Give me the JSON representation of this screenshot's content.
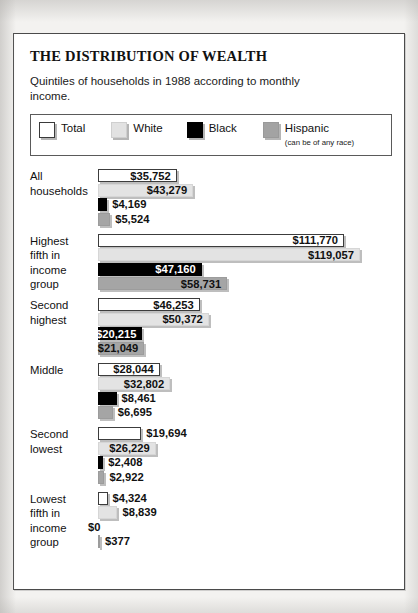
{
  "title": "THE DISTRIBUTION OF WEALTH",
  "subtitle": "Quintiles of households in 1988 according to monthly income.",
  "legend": {
    "total": "Total",
    "white": "White",
    "black": "Black",
    "hispanic": "Hispanic",
    "hispanic_note": "(can be of any race)"
  },
  "colors": {
    "total": "#ffffff",
    "white": "#e3e3e3",
    "black": "#000000",
    "hispanic": "#a5a5a5",
    "frame": "#4a4a4a",
    "text": "#111111"
  },
  "chart_data": {
    "type": "bar",
    "orientation": "horizontal",
    "title": "THE DISTRIBUTION OF WEALTH",
    "subtitle": "Quintiles of households in 1988 according to monthly income.",
    "xlabel": "",
    "ylabel": "",
    "grid": false,
    "legend_position": "top",
    "axis_max": 119057,
    "categories": [
      "All households",
      "Highest fifth in income group",
      "Second highest",
      "Middle",
      "Second lowest",
      "Lowest fifth in income group"
    ],
    "series": [
      {
        "name": "Total",
        "values": [
          35752,
          111770,
          46253,
          28044,
          19694,
          4324
        ]
      },
      {
        "name": "White",
        "values": [
          43279,
          119057,
          50372,
          32802,
          26229,
          8839
        ]
      },
      {
        "name": "Black",
        "values": [
          4169,
          47160,
          20215,
          8461,
          2408,
          0
        ]
      },
      {
        "name": "Hispanic",
        "values": [
          5524,
          58731,
          21049,
          6695,
          2922,
          377
        ]
      }
    ],
    "value_labels": [
      {
        "category": "All households",
        "labels": [
          "$35,752",
          "$43,279",
          "$4,169",
          "$5,524"
        ]
      },
      {
        "category": "Highest fifth in income group",
        "labels": [
          "$111,770",
          "$119,057",
          "$47,160",
          "$58,731"
        ]
      },
      {
        "category": "Second highest",
        "labels": [
          "$46,253",
          "$50,372",
          "$20,215",
          "$21,049"
        ]
      },
      {
        "category": "Middle",
        "labels": [
          "$28,044",
          "$32,802",
          "$8,461",
          "$6,695"
        ]
      },
      {
        "category": "Second lowest",
        "labels": [
          "$19,694",
          "$26,229",
          "$2,408",
          "$2,922"
        ]
      },
      {
        "category": "Lowest fifth in income group",
        "labels": [
          "$4,324",
          "$8,839",
          "$0",
          "$377"
        ]
      }
    ]
  },
  "groups": [
    {
      "label": "All\nhouseholds",
      "rows": [
        {
          "series": "total",
          "value": 35752,
          "label": "$35,752",
          "placement": "inside-light"
        },
        {
          "series": "white",
          "value": 43279,
          "label": "$43,279",
          "placement": "inside-light"
        },
        {
          "series": "black",
          "value": 4169,
          "label": "$4,169",
          "placement": "outside"
        },
        {
          "series": "hisp",
          "value": 5524,
          "label": "$5,524",
          "placement": "outside"
        }
      ]
    },
    {
      "label": "Highest\nfifth in\nincome\ngroup",
      "rows": [
        {
          "series": "total",
          "value": 111770,
          "label": "$111,770",
          "placement": "inside-light"
        },
        {
          "series": "white",
          "value": 119057,
          "label": "$119,057",
          "placement": "inside-light"
        },
        {
          "series": "black",
          "value": 47160,
          "label": "$47,160",
          "placement": "inside-dark"
        },
        {
          "series": "hisp",
          "value": 58731,
          "label": "$58,731",
          "placement": "inside-light"
        }
      ]
    },
    {
      "label": "Second\nhighest",
      "rows": [
        {
          "series": "total",
          "value": 46253,
          "label": "$46,253",
          "placement": "inside-light"
        },
        {
          "series": "white",
          "value": 50372,
          "label": "$50,372",
          "placement": "inside-light"
        },
        {
          "series": "black",
          "value": 20215,
          "label": "$20,215",
          "placement": "inside-dark"
        },
        {
          "series": "hisp",
          "value": 21049,
          "label": "$21,049",
          "placement": "inside-light"
        }
      ]
    },
    {
      "label": "Middle",
      "rows": [
        {
          "series": "total",
          "value": 28044,
          "label": "$28,044",
          "placement": "inside-light"
        },
        {
          "series": "white",
          "value": 32802,
          "label": "$32,802",
          "placement": "inside-light"
        },
        {
          "series": "black",
          "value": 8461,
          "label": "$8,461",
          "placement": "outside"
        },
        {
          "series": "hisp",
          "value": 6695,
          "label": "$6,695",
          "placement": "outside"
        }
      ]
    },
    {
      "label": "Second\nlowest",
      "rows": [
        {
          "series": "total",
          "value": 19694,
          "label": "$19,694",
          "placement": "outside"
        },
        {
          "series": "white",
          "value": 26229,
          "label": "$26,229",
          "placement": "inside-light"
        },
        {
          "series": "black",
          "value": 2408,
          "label": "$2,408",
          "placement": "outside"
        },
        {
          "series": "hisp",
          "value": 2922,
          "label": "$2,922",
          "placement": "outside"
        }
      ]
    },
    {
      "label": "Lowest\nfifth in\nincome\ngroup",
      "rows": [
        {
          "series": "total",
          "value": 4324,
          "label": "$4,324",
          "placement": "outside"
        },
        {
          "series": "white",
          "value": 8839,
          "label": "$8,839",
          "placement": "outside"
        },
        {
          "series": "black",
          "value": 0,
          "label": "$0",
          "placement": "zero"
        },
        {
          "series": "hisp",
          "value": 377,
          "label": "$377",
          "placement": "outside"
        }
      ]
    }
  ]
}
